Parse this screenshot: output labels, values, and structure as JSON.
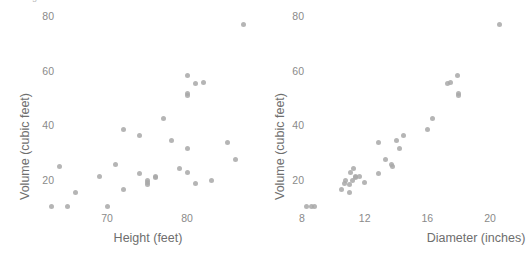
{
  "page": {
    "cut_off_text": "are the greatest.",
    "background": "#ffffff",
    "point_color": "#a8a8a8"
  },
  "chart_data": [
    {
      "type": "scatter",
      "title": "",
      "xlabel": "Height (feet)",
      "ylabel": "Volume (cubic feet)",
      "xlim": [
        62,
        88
      ],
      "ylim": [
        6,
        82
      ],
      "xticks": [
        70,
        80
      ],
      "yticks": [
        20,
        40,
        60,
        80
      ],
      "grid": false,
      "legend": null,
      "x": [
        70,
        65,
        63,
        72,
        81,
        83,
        66,
        75,
        80,
        75,
        79,
        76,
        76,
        69,
        75,
        74,
        85,
        86,
        71,
        64,
        78,
        80,
        74,
        72,
        77,
        81,
        82,
        80,
        80,
        80,
        87
      ],
      "y": [
        10.3,
        10.3,
        10.2,
        16.4,
        18.8,
        19.7,
        15.6,
        18.2,
        22.6,
        19.9,
        24.2,
        21.0,
        21.4,
        21.3,
        19.1,
        22.2,
        33.8,
        27.4,
        25.7,
        24.9,
        34.5,
        31.7,
        36.3,
        38.3,
        42.6,
        55.4,
        55.7,
        58.3,
        51.5,
        51.0,
        77.0
      ]
    },
    {
      "type": "scatter",
      "title": "",
      "xlabel": "Diameter (inches)",
      "ylabel": "Volume (cubic feet)",
      "xlim": [
        7.4,
        21.2
      ],
      "ylim": [
        6,
        82
      ],
      "xticks": [
        8,
        12,
        16,
        20
      ],
      "yticks": [
        20,
        40,
        60,
        80
      ],
      "grid": false,
      "legend": null,
      "x": [
        8.3,
        8.6,
        8.8,
        10.5,
        10.7,
        10.8,
        11.0,
        11.0,
        11.1,
        11.2,
        11.3,
        11.4,
        11.4,
        11.7,
        12.0,
        12.9,
        12.9,
        13.3,
        13.7,
        13.8,
        14.0,
        14.2,
        14.5,
        16.0,
        16.3,
        17.3,
        17.5,
        17.9,
        18.0,
        18.0,
        20.6
      ],
      "y": [
        10.3,
        10.3,
        10.2,
        16.4,
        18.8,
        19.7,
        15.6,
        18.2,
        22.6,
        19.9,
        24.2,
        21.0,
        21.4,
        21.3,
        19.1,
        22.2,
        33.8,
        27.4,
        25.7,
        24.9,
        34.5,
        31.7,
        36.3,
        38.3,
        42.6,
        55.4,
        55.7,
        58.3,
        51.5,
        51.0,
        77.0
      ]
    }
  ]
}
